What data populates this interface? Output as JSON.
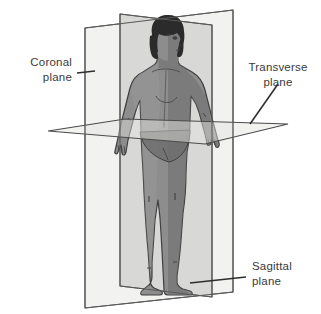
{
  "labels": {
    "coronal": {
      "line1": "Coronal",
      "line2": "plane"
    },
    "transverse": {
      "line1": "Transverse",
      "line2": "plane"
    },
    "sagittal": {
      "line1": "Sagittal",
      "line2": "plane"
    }
  },
  "colors": {
    "outline": "#4a4a4a",
    "label_text": "#3a3a3a",
    "coronal_plane_fill": "#f2f2f0",
    "sagittal_plane_fill": "#d6d6d4",
    "transverse_plane_fill": "#e4e4e2",
    "body_fill": "#8d8d8d",
    "body_shadow": "#6e6e6e",
    "body_highlight": "#a0a0a0",
    "hair": "#2b2b2b",
    "background": "#ffffff"
  },
  "geometry": {
    "coronal_plane_points": "85,28 233,10 233,292 85,308",
    "sagittal_plane_points": "120,14 212,25 212,297 120,286",
    "transverse_plane_points": "48,131 125,119 288,124 205,144"
  }
}
